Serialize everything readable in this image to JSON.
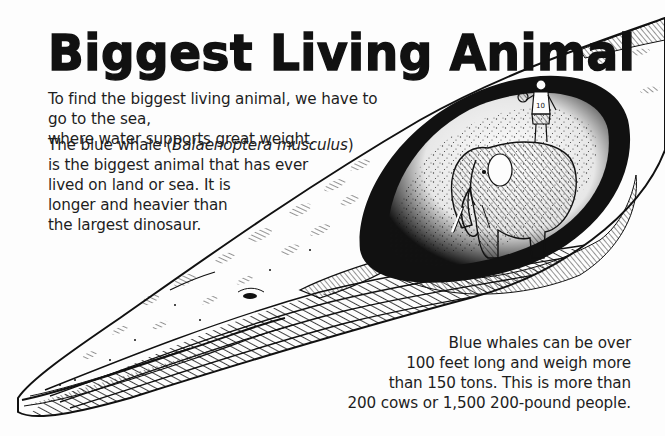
{
  "title": "Biggest Living Animal",
  "intro": {
    "line1": "To find the biggest living animal, we have to go to the sea,",
    "line2": "where water supports great weight."
  },
  "species": {
    "before_name": "The blue whale (",
    "scientific_name": "Balaenoptera musculus",
    "after_name": ")",
    "line2": "is the biggest animal that has ever",
    "line3": "lived on land or sea. It is",
    "line4": "longer and heavier than",
    "line5": "the largest dinosaur."
  },
  "facts": {
    "line1": "Blue whales can be over",
    "line2": "100 feet long and weigh more",
    "line3": "than 150 tons. This is more than",
    "line4": "200 cows or 1,500  200-pound people."
  },
  "illustration": {
    "subject": "blue-whale-cutaway",
    "contents": [
      "elephant",
      "basketball-player"
    ],
    "jersey_number": "10",
    "colors": {
      "ink": "#111111",
      "paper": "#fdfdfd"
    }
  }
}
